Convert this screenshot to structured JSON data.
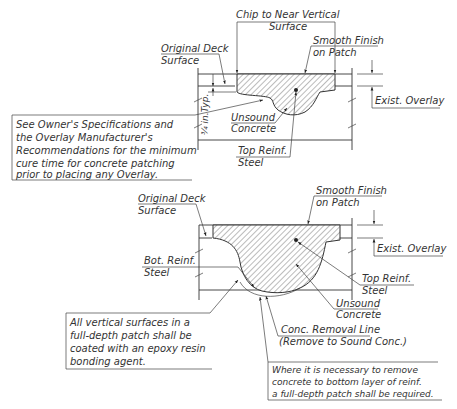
{
  "top_detail": {
    "name": "partial-depth-patch",
    "labels": {
      "chip": [
        "Chip to Near Vertical",
        "Surface"
      ],
      "original_deck": [
        "Original Deck",
        "Surface"
      ],
      "smooth_finish": [
        "Smooth Finish",
        "on Patch"
      ],
      "exist_overlay": "Exist. Overlay",
      "dimension": "¾ in.Typ.",
      "unsound": [
        "Unsound",
        "Concrete"
      ],
      "top_reinf": [
        "Top Reinf.",
        "Steel"
      ]
    },
    "note": [
      "See Owner's Specifications and",
      "the Overlay Manufacturer's",
      "Recommendations for the minimum",
      "cure time for concrete patching",
      "prior to placing any Overlay."
    ]
  },
  "bottom_detail": {
    "name": "full-depth-patch",
    "labels": {
      "original_deck": [
        "Original Deck",
        "Surface"
      ],
      "smooth_finish": [
        "Smooth Finish",
        "on Patch"
      ],
      "exist_overlay": "Exist. Overlay",
      "bot_reinf": [
        "Bot. Reinf.",
        "Steel"
      ],
      "top_reinf": [
        "Top Reinf.",
        "Steel"
      ],
      "unsound": [
        "Unsound",
        "Concrete"
      ],
      "removal_line": [
        "Conc. Removal Line",
        "(Remove to Sound Conc.)"
      ]
    },
    "note_epoxy": [
      "All vertical surfaces in a",
      "full-depth patch shall be",
      "coated with an epoxy resin",
      "bonding agent."
    ],
    "note_full_depth": [
      "Where it is necessary to remove",
      "concrete to bottom layer of reinf.",
      "a full-depth patch shall be required."
    ]
  },
  "colors": {
    "line": "#333333",
    "background": "#ffffff"
  }
}
